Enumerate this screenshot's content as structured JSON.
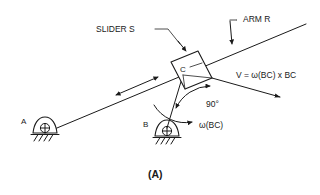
{
  "figure": {
    "caption": "(A)",
    "labels": {
      "slider": "SLIDER S",
      "arm": "ARM R",
      "velocity": "V = ω(BC) x BC",
      "angle": "90°",
      "omega": "ω(BC)",
      "node_a": "A",
      "node_b": "B",
      "node_c": "C"
    },
    "colors": {
      "ink": "#1a1a1a",
      "background": "#ffffff",
      "leader": "#3a3a3a"
    }
  }
}
